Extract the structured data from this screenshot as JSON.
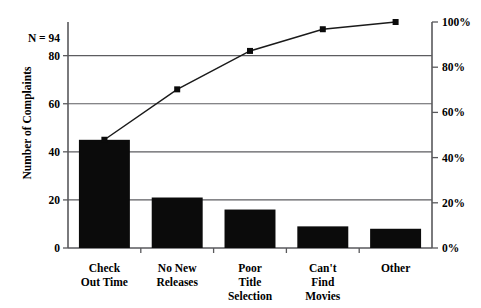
{
  "chart_data": {
    "type": "bar",
    "title": "",
    "subtitle": "",
    "xlabel": "",
    "ylabel": "Number of Complaints",
    "y2label": "",
    "categories": [
      "Check\nOut Time",
      "No New\nReleases",
      "Poor\nTitle\nSelection",
      "Can't\nFind\nMovies",
      "Other"
    ],
    "category_lines": [
      [
        "Check",
        "Out Time"
      ],
      [
        "No New",
        "Releases"
      ],
      [
        "Poor",
        "Title",
        "Selection"
      ],
      [
        "Can't",
        "Find",
        "Movies"
      ],
      [
        "Other"
      ]
    ],
    "values": [
      45,
      21,
      16,
      9,
      8
    ],
    "cumulative_percent": [
      47.9,
      70.2,
      87.2,
      96.8,
      100.0
    ],
    "ylim": [
      0,
      94
    ],
    "y2lim": [
      0,
      100
    ],
    "yticks": [
      0,
      20,
      40,
      60,
      80
    ],
    "ytick_labels": [
      "0",
      "20",
      "40",
      "60",
      "80"
    ],
    "y2ticks": [
      0,
      20,
      40,
      60,
      80,
      100
    ],
    "y2tick_labels": [
      "0%",
      "20%",
      "40%",
      "60%",
      "80%",
      "100%"
    ],
    "grid": true,
    "grid_axis": "y",
    "legend": false,
    "annotations": [
      {
        "name": "sample-size",
        "text": "N = 94"
      }
    ],
    "colors": {
      "bar": "#0b0b0b",
      "line": "#1a1a1a",
      "axis": "#59595c",
      "grid": "#5d5d60",
      "background": "#ffffff"
    }
  }
}
